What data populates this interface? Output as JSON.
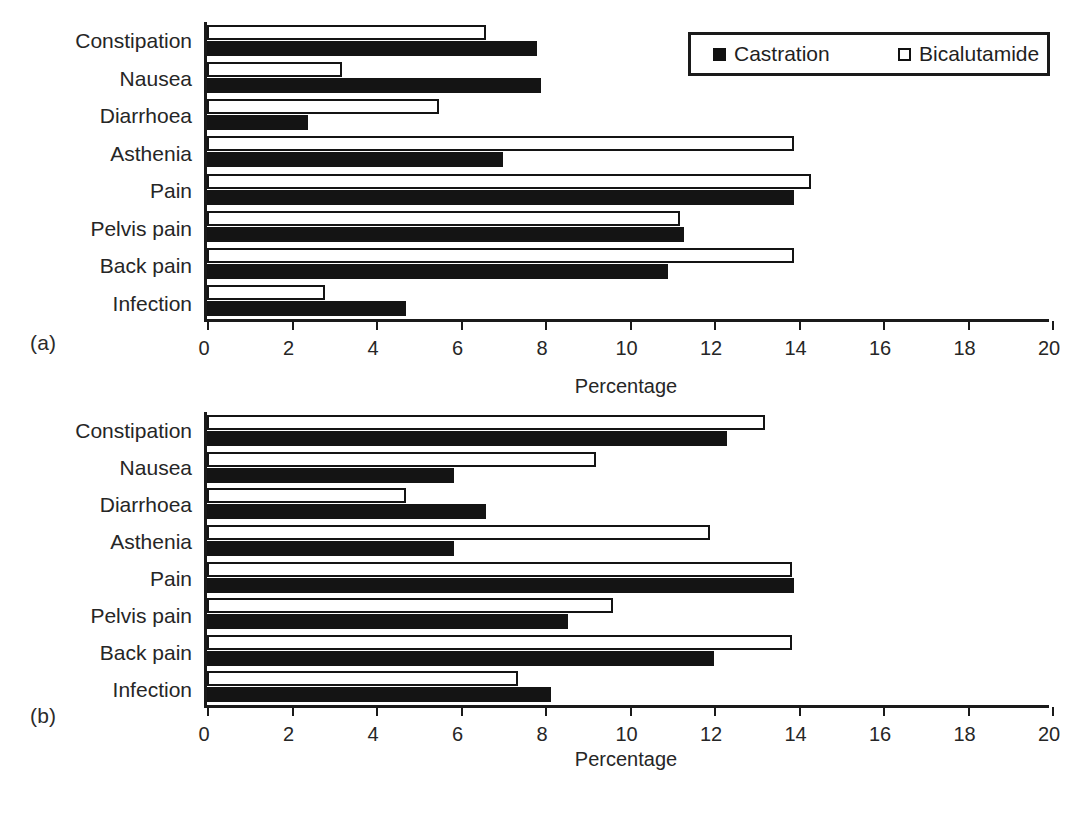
{
  "figure": {
    "panel_tags": [
      "(a)",
      "(b)"
    ],
    "legend": {
      "entries": [
        {
          "label": "Castration",
          "marker": "filled-square-icon",
          "color": "#111111"
        },
        {
          "label": "Bicalutamide",
          "marker": "open-square-icon",
          "color": "#ffffff"
        }
      ]
    }
  },
  "chart_data": [
    {
      "type": "bar",
      "orientation": "horizontal",
      "panel": "(a)",
      "title": "",
      "xlabel": "Percentage",
      "ylabel": "",
      "xlim": [
        0,
        20
      ],
      "xticks": [
        0,
        2,
        4,
        6,
        8,
        10,
        12,
        14,
        16,
        18,
        20
      ],
      "xticklabels": [
        "0",
        "2",
        "4",
        "6",
        "8",
        "10",
        "12",
        "14",
        "16",
        "18",
        "20"
      ],
      "grid": false,
      "legend_position": "top-right",
      "categories": [
        "Constipation",
        "Nausea",
        "Diarrhoea",
        "Asthenia",
        "Pain",
        "Pelvis pain",
        "Back pain",
        "Infection"
      ],
      "series": [
        {
          "name": "Bicalutamide",
          "style": "open",
          "values": [
            6.6,
            3.2,
            5.5,
            13.9,
            14.3,
            11.2,
            13.9,
            2.8
          ]
        },
        {
          "name": "Castration",
          "style": "filled",
          "values": [
            7.8,
            7.9,
            2.4,
            7.0,
            13.9,
            11.3,
            10.9,
            4.7
          ]
        }
      ]
    },
    {
      "type": "bar",
      "orientation": "horizontal",
      "panel": "(b)",
      "title": "",
      "xlabel": "Percentage",
      "ylabel": "",
      "xlim": [
        0,
        20
      ],
      "xticks": [
        0,
        2,
        4,
        6,
        8,
        10,
        12,
        14,
        16,
        18,
        20
      ],
      "xticklabels": [
        "0",
        "2",
        "4",
        "6",
        "8",
        "10",
        "12",
        "14",
        "16",
        "18",
        "20"
      ],
      "grid": false,
      "legend_position": "none",
      "categories": [
        "Constipation",
        "Nausea",
        "Diarrhoea",
        "Asthenia",
        "Pain",
        "Pelvis pain",
        "Back pain",
        "Infection"
      ],
      "series": [
        {
          "name": "Bicalutamide",
          "style": "open",
          "values": [
            13.2,
            9.2,
            4.7,
            11.9,
            13.85,
            9.6,
            13.85,
            7.35
          ]
        },
        {
          "name": "Castration",
          "style": "filled",
          "values": [
            12.3,
            5.85,
            6.6,
            5.85,
            13.9,
            8.55,
            12.0,
            8.15
          ]
        }
      ]
    }
  ]
}
